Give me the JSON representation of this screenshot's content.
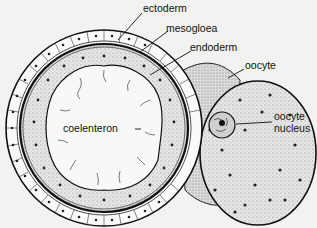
{
  "diagram": {
    "labels": {
      "ectoderm": "ectoderm",
      "mesogloea": "mesogloea",
      "endoderm": "endoderm",
      "oocyte": "oocyte",
      "oocyte_nucleus_line1": "oocyte",
      "oocyte_nucleus_line2": "nucleus",
      "coelenteron": "coelenteron"
    },
    "colors": {
      "background": "#f2f2f0",
      "ink": "#111111",
      "stipple": "#bdbdbd"
    }
  }
}
